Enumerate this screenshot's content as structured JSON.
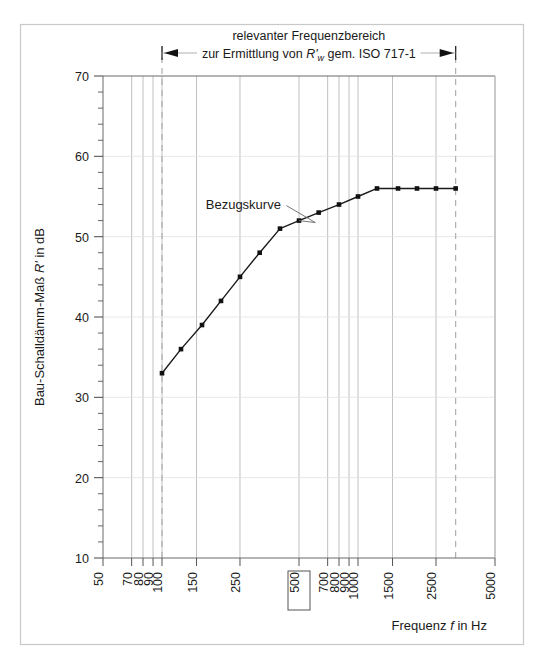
{
  "figure": {
    "title_lines": [
      "relevanter Frequenzbereich",
      "zur Ermittlung von R'w gem. ISO 717-1"
    ],
    "title_line2_parts": {
      "before": "zur Ermittlung von ",
      "symbol": "R'",
      "subscript": "w",
      "after": " gem. ISO 717-1"
    },
    "curve_label": "Bezugskurve",
    "highlighted_tick": "500",
    "range_marker": {
      "left_freq": 100,
      "right_freq": 3150,
      "left_arrow": "arrow-left",
      "right_arrow": "arrow-right"
    },
    "colors": {
      "frame": "#c8c8c8",
      "axis": "#4a4a4a",
      "grid": "#b9b9b9",
      "grid_minor": "#d6d6d6",
      "dashed": "#a8a8a8",
      "curve": "#1a1a1a",
      "marker": "#111111",
      "text": "#1a1a1a"
    }
  },
  "chart_data": {
    "type": "line",
    "xlabel": "Frequenz f in Hz",
    "ylabel": "Bau-Schalldämm-Maß R' in dB",
    "xscale": "log",
    "xlim": [
      50,
      5000
    ],
    "ylim": [
      10,
      70
    ],
    "grid": true,
    "legend": "none",
    "series": [
      {
        "name": "Bezugskurve",
        "x": [
          100,
          125,
          160,
          200,
          250,
          315,
          400,
          500,
          630,
          800,
          1000,
          1250,
          1600,
          2000,
          2500,
          3150
        ],
        "values": [
          33,
          36,
          39,
          42,
          45,
          48,
          51,
          52,
          53,
          54,
          55,
          56,
          56,
          56,
          56,
          56
        ]
      }
    ],
    "xticks": [
      50,
      70,
      80,
      90,
      100,
      150,
      250,
      500,
      700,
      800,
      900,
      1000,
      1500,
      2500,
      5000
    ],
    "xtick_labels": [
      "50",
      "70",
      "80",
      "90",
      "100",
      "150",
      "250",
      "500",
      "700",
      "800",
      "900",
      "1000",
      "1500",
      "2500",
      "5000"
    ],
    "yticks": [
      10,
      20,
      30,
      40,
      50,
      60,
      70
    ],
    "ytick_labels": [
      "10",
      "20",
      "30",
      "40",
      "50",
      "60",
      "70"
    ],
    "ytick_minor_step": 2,
    "annotations": [
      {
        "text": "Bezugskurve",
        "x": 260,
        "y": 53.5,
        "points_to_x": 500,
        "points_to_y": 52
      }
    ]
  }
}
